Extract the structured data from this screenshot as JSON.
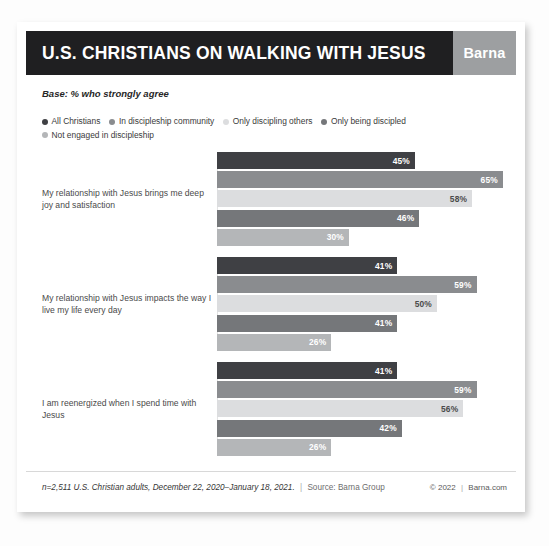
{
  "header": {
    "title": "U.S. CHRISTIANS ON WALKING WITH JESUS",
    "brand": "Barna"
  },
  "base_note": "Base: % who strongly agree",
  "footer": {
    "sample": "n=2,511 U.S. Christian adults, December 22, 2020–January 18, 2021.",
    "separator": "|",
    "source": "Source: Barna Group",
    "copyright": "© 2022",
    "copyright_separator": "|",
    "website": "Barna.com"
  },
  "colors": {
    "header_bg": "#1f1f21",
    "brand_bg": "#9d9fa1",
    "series": [
      "#3f4044",
      "#8a8c8f",
      "#dcdddf",
      "#75777a",
      "#b4b6b8"
    ],
    "value_text_dark": "#4a4a4a",
    "value_text_light": "#ffffff"
  },
  "chart_data": {
    "type": "bar",
    "orientation": "horizontal",
    "title": "U.S. CHRISTIANS ON WALKING WITH JESUS",
    "subtitle": "Base: % who strongly agree",
    "xlabel": "",
    "ylabel": "",
    "xlim": [
      0,
      70
    ],
    "grid": false,
    "legend_position": "top",
    "value_suffix": "%",
    "categories": [
      "My relationship with Jesus brings me deep joy and satisfaction",
      "My relationship with Jesus impacts the way I live my life every day",
      "I am reenergized when I spend time with Jesus"
    ],
    "series": [
      {
        "name": "All Christians",
        "color": "#3f4044",
        "values": [
          45,
          41,
          41
        ]
      },
      {
        "name": "In discipleship community",
        "color": "#8a8c8f",
        "values": [
          65,
          59,
          59
        ]
      },
      {
        "name": "Only discipling others",
        "color": "#dcdddf",
        "values": [
          58,
          50,
          56
        ]
      },
      {
        "name": "Only being discipled",
        "color": "#75777a",
        "values": [
          46,
          41,
          42
        ]
      },
      {
        "name": "Not engaged in discipleship",
        "color": "#b4b6b8",
        "values": [
          30,
          26,
          26
        ]
      }
    ],
    "labels": [
      [
        "45%",
        "65%",
        "58%",
        "46%",
        "30%"
      ],
      [
        "41%",
        "59%",
        "50%",
        "41%",
        "26%"
      ],
      [
        "41%",
        "59%",
        "56%",
        "42%",
        "26%"
      ]
    ]
  }
}
